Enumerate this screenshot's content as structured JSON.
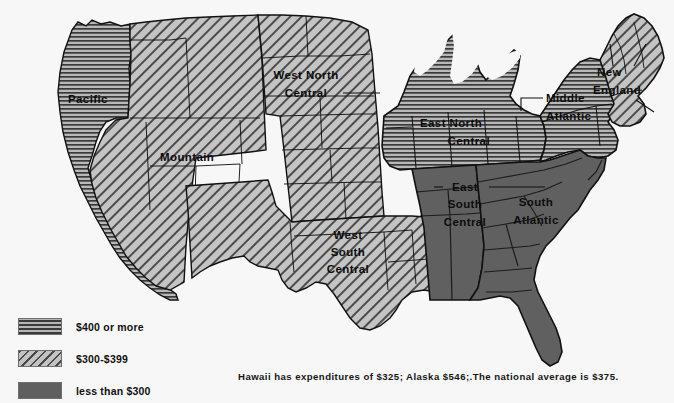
{
  "map": {
    "title": "United States Census Divisions — Per-Capita Expenditures",
    "background_color": "#f7f7f7",
    "outline_color": "#111111",
    "regions": [
      {
        "id": "pacific",
        "label_lines": [
          "Pacific"
        ],
        "category": "400plus",
        "pattern": "horizontal-lines"
      },
      {
        "id": "mountain",
        "label_lines": [
          "Mountain"
        ],
        "category": "300to399",
        "pattern": "diagonal-lines"
      },
      {
        "id": "west-north-central",
        "label_lines": [
          "West North",
          "Central"
        ],
        "category": "300to399",
        "pattern": "diagonal-lines"
      },
      {
        "id": "west-south-central",
        "label_lines": [
          "West",
          "South",
          "Central"
        ],
        "category": "300to399",
        "pattern": "diagonal-lines"
      },
      {
        "id": "east-north-central",
        "label_lines": [
          "East North",
          "Central"
        ],
        "category": "400plus",
        "pattern": "horizontal-lines"
      },
      {
        "id": "east-south-central",
        "label_lines": [
          "East",
          "South",
          "Central"
        ],
        "category": "under300",
        "pattern": "solid-dark"
      },
      {
        "id": "south-atlantic",
        "label_lines": [
          "South",
          "Atlantic"
        ],
        "category": "under300",
        "pattern": "solid-dark"
      },
      {
        "id": "middle-atlantic",
        "label_lines": [
          "Middle",
          "Atlantic"
        ],
        "category": "400plus",
        "pattern": "horizontal-lines"
      },
      {
        "id": "new-england",
        "label_lines": [
          "New",
          "England"
        ],
        "category": "300to399",
        "pattern": "diagonal-lines"
      }
    ]
  },
  "legend": {
    "items": [
      {
        "swatch": "horizontal-lines",
        "label": "$400 or more",
        "color": "#3a3a3a"
      },
      {
        "swatch": "diagonal-lines",
        "label": "$300-$399",
        "color": "#4a4a4a"
      },
      {
        "swatch": "solid-dark",
        "label": "less than $300",
        "color": "#5f5f5f"
      }
    ]
  },
  "footnote": {
    "text": "Hawaii has expenditures of $325; Alaska $546;.The national average is $375."
  },
  "values_mentioned": {
    "hawaii": "$325",
    "alaska": "$546",
    "national_average": "$375"
  }
}
